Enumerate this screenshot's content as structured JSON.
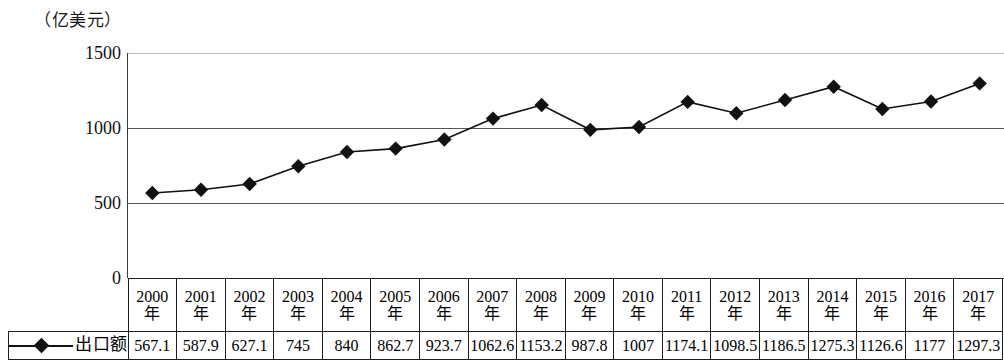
{
  "unit_label": "（亿美元）",
  "axis": {
    "y_ticks": [
      "1500",
      "1000",
      "500",
      "0"
    ],
    "y_values": [
      1500,
      1000,
      500,
      0
    ],
    "y_min": 0,
    "y_max": 1500
  },
  "legend": {
    "label": "出口额",
    "marker_icon": "diamond-marker",
    "marker_color": "#111111",
    "line_color": "#111111"
  },
  "table": {
    "year_suffix": "年",
    "years": [
      "2000",
      "2001",
      "2002",
      "2003",
      "2004",
      "2005",
      "2006",
      "2007",
      "2008",
      "2009",
      "2010",
      "2011",
      "2012",
      "2013",
      "2014",
      "2015",
      "2016",
      "2017"
    ],
    "values": [
      "567.1",
      "587.9",
      "627.1",
      "745",
      "840",
      "862.7",
      "923.7",
      "1062.6",
      "1153.2",
      "987.8",
      "1007",
      "1174.1",
      "1098.5",
      "1186.5",
      "1275.3",
      "1126.6",
      "1177",
      "1297.3"
    ]
  },
  "chart_data": {
    "type": "line",
    "title": "",
    "subtitle": "",
    "xlabel": "",
    "ylabel": "（亿美元）",
    "categories": [
      "2000年",
      "2001年",
      "2002年",
      "2003年",
      "2004年",
      "2005年",
      "2006年",
      "2007年",
      "2008年",
      "2009年",
      "2010年",
      "2011年",
      "2012年",
      "2013年",
      "2014年",
      "2015年",
      "2016年",
      "2017年"
    ],
    "series": [
      {
        "name": "出口额",
        "values": [
          567.1,
          587.9,
          627.1,
          745,
          840,
          862.7,
          923.7,
          1062.6,
          1153.2,
          987.8,
          1007,
          1174.1,
          1098.5,
          1186.5,
          1275.3,
          1126.6,
          1177,
          1297.3
        ]
      }
    ],
    "ylim": [
      0,
      1500
    ],
    "yticks": [
      0,
      500,
      1000,
      1500
    ],
    "grid": true,
    "legend_position": "table-row-header",
    "marker": "diamond",
    "line_color": "#111111"
  }
}
